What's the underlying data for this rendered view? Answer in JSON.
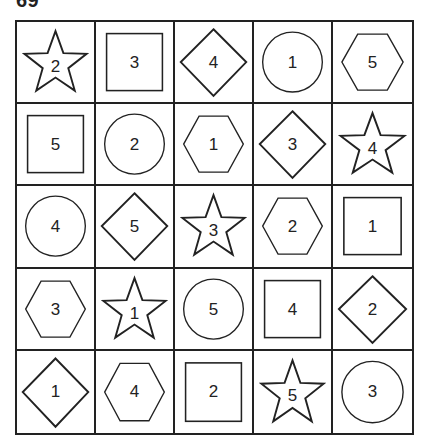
{
  "puzzle": {
    "label": "69",
    "rows": 5,
    "cols": 5,
    "stroke_color": "#222222",
    "background_color": "#ffffff",
    "cells": [
      [
        {
          "shape": "star",
          "number": "2"
        },
        {
          "shape": "square",
          "number": "3"
        },
        {
          "shape": "diamond",
          "number": "4"
        },
        {
          "shape": "circle",
          "number": "1"
        },
        {
          "shape": "hexagon",
          "number": "5"
        }
      ],
      [
        {
          "shape": "square",
          "number": "5"
        },
        {
          "shape": "circle",
          "number": "2"
        },
        {
          "shape": "hexagon",
          "number": "1"
        },
        {
          "shape": "diamond",
          "number": "3"
        },
        {
          "shape": "star",
          "number": "4"
        }
      ],
      [
        {
          "shape": "circle",
          "number": "4"
        },
        {
          "shape": "diamond",
          "number": "5"
        },
        {
          "shape": "star",
          "number": "3"
        },
        {
          "shape": "hexagon",
          "number": "2"
        },
        {
          "shape": "square",
          "number": "1"
        }
      ],
      [
        {
          "shape": "hexagon",
          "number": "3"
        },
        {
          "shape": "star",
          "number": "1"
        },
        {
          "shape": "circle",
          "number": "5"
        },
        {
          "shape": "square",
          "number": "4"
        },
        {
          "shape": "diamond",
          "number": "2"
        }
      ],
      [
        {
          "shape": "diamond",
          "number": "1"
        },
        {
          "shape": "hexagon",
          "number": "4"
        },
        {
          "shape": "square",
          "number": "2"
        },
        {
          "shape": "star",
          "number": "5"
        },
        {
          "shape": "circle",
          "number": "3"
        }
      ]
    ]
  }
}
